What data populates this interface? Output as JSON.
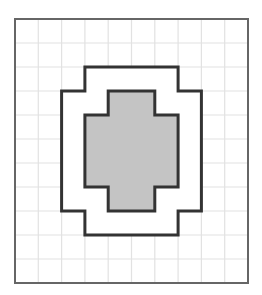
{
  "figure": {
    "type": "grid-area-diagram",
    "grid": {
      "columns": 10,
      "rows": 11,
      "origin_px": [
        15,
        19
      ],
      "cell_px": [
        23.3,
        24
      ],
      "grid_line_color": "#e2e2e2",
      "border_color": "#666666"
    },
    "shapes": [
      {
        "id": "outer-frame-shape",
        "description": "Outer stepped octagonal outline (white interior)",
        "fill": "#ffffff",
        "stroke": "#333333",
        "vertices_grid": [
          [
            3,
            2
          ],
          [
            7,
            2
          ],
          [
            7,
            3
          ],
          [
            8,
            3
          ],
          [
            8,
            8
          ],
          [
            7,
            8
          ],
          [
            7,
            9
          ],
          [
            3,
            9
          ],
          [
            3,
            8
          ],
          [
            2,
            8
          ],
          [
            2,
            3
          ],
          [
            3,
            3
          ]
        ]
      },
      {
        "id": "inner-cross-shape",
        "description": "Inner shaded stepped cross shape",
        "fill": "#c4c4c4",
        "stroke": "#333333",
        "vertices_grid": [
          [
            4,
            3
          ],
          [
            6,
            3
          ],
          [
            6,
            4
          ],
          [
            7,
            4
          ],
          [
            7,
            7
          ],
          [
            6,
            7
          ],
          [
            6,
            8
          ],
          [
            4,
            8
          ],
          [
            4,
            7
          ],
          [
            3,
            7
          ],
          [
            3,
            4
          ],
          [
            4,
            4
          ]
        ]
      }
    ]
  }
}
